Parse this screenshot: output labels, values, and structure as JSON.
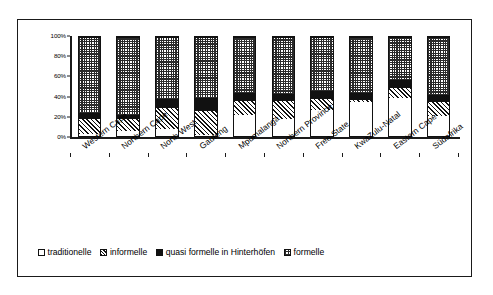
{
  "chart_data": {
    "type": "bar",
    "subtype": "stacked-percentage-column",
    "title": "",
    "xlabel": "",
    "ylabel": "",
    "ylim": [
      0,
      100
    ],
    "yticks": [
      "0%",
      "20%",
      "40%",
      "60%",
      "80%",
      "100%"
    ],
    "ytick_values": [
      0,
      20,
      40,
      60,
      80,
      100
    ],
    "grid": false,
    "legend_position": "bottom-left",
    "categories": [
      "Western Cape",
      "Northern Cape",
      "North West",
      "Gauteng",
      "Mpumalanga",
      "Northern Province",
      "Free State",
      "KwaZulu-Natal",
      "Eastern Cape",
      "Südafrika"
    ],
    "series": [
      {
        "name": "traditionelle",
        "pattern": "white",
        "values": [
          2,
          5,
          7,
          1,
          21,
          17,
          26,
          34,
          38,
          20
        ]
      },
      {
        "name": "informelle",
        "pattern": "diagonal-hatch",
        "values": [
          16,
          13,
          22,
          25,
          15,
          19,
          12,
          3,
          12,
          15
        ]
      },
      {
        "name": "quasi formelle in Hinterhöfen",
        "pattern": "solid-black",
        "values": [
          5,
          3,
          8,
          12,
          7,
          6,
          7,
          6,
          7,
          6
        ]
      },
      {
        "name": "formelle",
        "pattern": "checker-grey",
        "values": [
          77,
          79,
          63,
          62,
          57,
          58,
          55,
          57,
          43,
          59
        ]
      }
    ]
  },
  "legend": {
    "items": [
      {
        "label": "traditionelle",
        "swatch": "traditionelle"
      },
      {
        "label": "informelle",
        "swatch": "informelle"
      },
      {
        "label": "quasi formelle in Hinterhöfen",
        "swatch": "quasi"
      },
      {
        "label": "formelle",
        "swatch": "formelle"
      }
    ]
  }
}
